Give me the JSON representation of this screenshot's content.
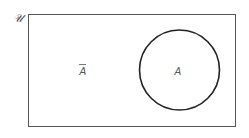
{
  "diagram": {
    "type": "venn",
    "universe_label": "𝒰",
    "sets": [
      {
        "label": "A",
        "region": "inside circle"
      }
    ],
    "complement_label": "A",
    "complement_overbar": true,
    "colors": {
      "stroke": "#222222",
      "rect_stroke": "#555555",
      "label": "#555555"
    }
  }
}
